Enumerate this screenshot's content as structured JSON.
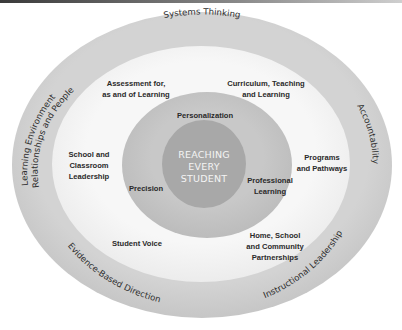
{
  "diagram": {
    "colors": {
      "outer_ring": "#cfcfcf",
      "white_ring": "#f5f5f5",
      "middle_ring": "#c3c3c3",
      "core": "#a8a8a8",
      "core_text": "#f4f4f4",
      "label_text": "#2a2a2a"
    },
    "core": {
      "lines": [
        "REACHING",
        "EVERY",
        "STUDENT"
      ]
    },
    "middle_ring": {
      "labels": [
        {
          "id": "personalization",
          "lines": [
            "Personalization"
          ]
        },
        {
          "id": "precision",
          "lines": [
            "Precision"
          ]
        },
        {
          "id": "professional-learning",
          "lines": [
            "Professional",
            "Learning"
          ]
        }
      ]
    },
    "white_ring": {
      "labels": [
        {
          "id": "assessment",
          "lines": [
            "Assessment for,",
            "as and of Learning"
          ]
        },
        {
          "id": "curriculum",
          "lines": [
            "Curriculum, Teaching",
            "and Learning"
          ]
        },
        {
          "id": "school-classroom-leadership",
          "lines": [
            "School and",
            "Classroom",
            "Leadership"
          ]
        },
        {
          "id": "programs-pathways",
          "lines": [
            "Programs",
            "and Pathways"
          ]
        },
        {
          "id": "student-voice",
          "lines": [
            "Student Voice"
          ]
        },
        {
          "id": "home-school-community",
          "lines": [
            "Home, School",
            "and Community",
            "Partnerships"
          ]
        }
      ]
    },
    "outer_ring": {
      "labels": [
        {
          "id": "systems-thinking",
          "text": "Systems Thinking"
        },
        {
          "id": "accountability",
          "text": "Accountability"
        },
        {
          "id": "instructional-leadership",
          "text": "Instructional Leadership"
        },
        {
          "id": "evidence-based-direction",
          "text": "Evidence-Based Direction"
        },
        {
          "id": "learning-environment",
          "text": "Learning Environment"
        },
        {
          "id": "relationships-people",
          "text": "Relationships and People"
        }
      ]
    }
  }
}
